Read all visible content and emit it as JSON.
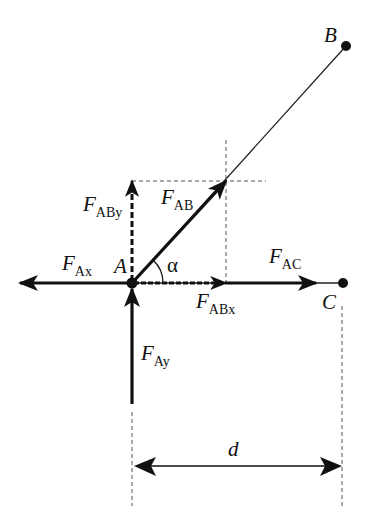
{
  "diagram": {
    "type": "free-body force diagram",
    "points": {
      "A": {
        "label": "A"
      },
      "B": {
        "label": "B"
      },
      "C": {
        "label": "C"
      }
    },
    "angle": {
      "label": "α"
    },
    "dimension": {
      "label": "d"
    },
    "forces": [
      {
        "id": "FAx",
        "main": "F",
        "sub": "Ax",
        "direction": "left",
        "style": "solid"
      },
      {
        "id": "FAy",
        "main": "F",
        "sub": "Ay",
        "direction": "up",
        "style": "solid"
      },
      {
        "id": "FAB",
        "main": "F",
        "sub": "AB",
        "direction": "along AB",
        "style": "solid"
      },
      {
        "id": "FABx",
        "main": "F",
        "sub": "ABx",
        "direction": "right",
        "style": "dashed"
      },
      {
        "id": "FABy",
        "main": "F",
        "sub": "ABy",
        "direction": "up",
        "style": "dashed"
      },
      {
        "id": "FAC",
        "main": "F",
        "sub": "AC",
        "direction": "right",
        "style": "solid"
      }
    ],
    "colors": {
      "ink": "#111111",
      "background": "#ffffff",
      "dashes": "#555555"
    }
  }
}
